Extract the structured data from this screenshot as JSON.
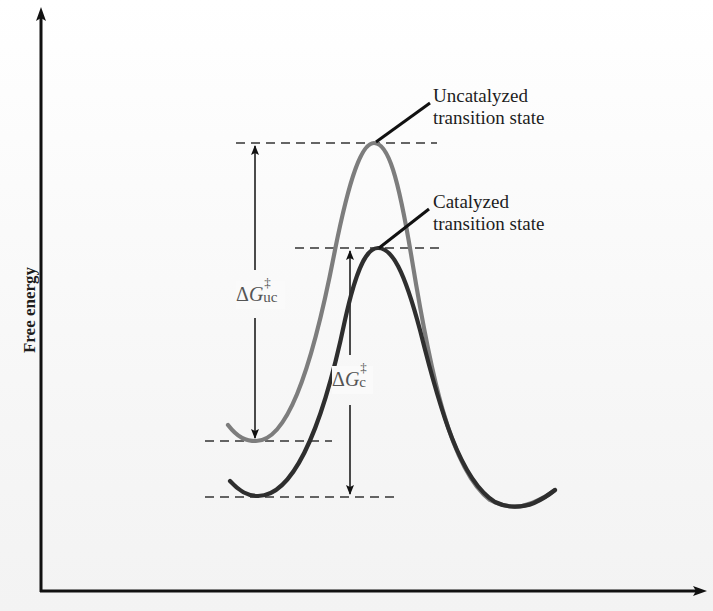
{
  "diagram": {
    "type": "reaction-energy-profile",
    "y_axis": {
      "label": "Free energy"
    },
    "x_axis": {
      "label": ""
    },
    "annotations": {
      "uncatalyzed_ts": {
        "line1": "Uncatalyzed",
        "line2": "transition state"
      },
      "catalyzed_ts": {
        "line1": "Catalyzed",
        "line2": "transition state"
      },
      "dg_uncatalyzed": {
        "delta": "Δ",
        "symbol": "G",
        "sup": "‡",
        "sub": "uc"
      },
      "dg_catalyzed": {
        "delta": "Δ",
        "symbol": "G",
        "sup": "‡",
        "sub": "c"
      }
    },
    "curves": [
      {
        "name": "Uncatalyzed",
        "color": "#7d7d7d",
        "relative_peak_height": "higher"
      },
      {
        "name": "Catalyzed",
        "color": "#2e2e2e",
        "relative_peak_height": "lower"
      }
    ],
    "colors": {
      "axis": "#111111",
      "uncatalyzed_curve": "#7d7d7d",
      "catalyzed_curve": "#2e2e2e",
      "dashed_lines": "#333333",
      "text": "#1d1d1d"
    }
  }
}
